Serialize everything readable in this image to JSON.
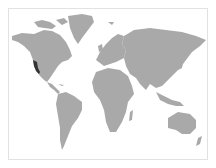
{
  "map": {
    "type": "world-choropleth",
    "projection": "miller",
    "colors": {
      "background": "#ffffff",
      "frame": "#e2e2e2",
      "land": "#a9a9a9",
      "highlight": "#333333"
    },
    "highlighted_regions": [
      {
        "name": "California",
        "country": "United States",
        "color": "#333333"
      }
    ]
  }
}
